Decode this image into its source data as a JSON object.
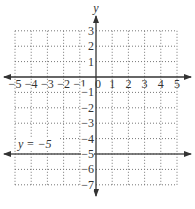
{
  "chart_data": {
    "type": "line",
    "title": "",
    "xlabel": "",
    "ylabel": "y",
    "xlim": [
      -5,
      5
    ],
    "ylim": [
      -7,
      3
    ],
    "grid": true,
    "grid_style": "dotted",
    "x_ticks": [
      -5,
      -4,
      -3,
      -2,
      -1,
      0,
      1,
      2,
      3,
      4,
      5
    ],
    "y_ticks": [
      3,
      2,
      1,
      -1,
      -2,
      -3,
      -4,
      -5,
      -6,
      -7
    ],
    "x_tick_labels": [
      "−5",
      "−4",
      "−3",
      "−2",
      "−1",
      "0",
      "1",
      "2",
      "3",
      "4",
      "5"
    ],
    "y_tick_labels": [
      "3",
      "2",
      "1",
      "−1",
      "−2",
      "−3",
      "−4",
      "−5",
      "−6",
      "−7"
    ],
    "series": [
      {
        "name": "y = −5",
        "equation": "y = -5",
        "x": [
          -5.8,
          5.8
        ],
        "y": [
          -5,
          -5
        ],
        "arrows": "both"
      }
    ],
    "annotations": [
      {
        "text": "y = −5",
        "x": -4.7,
        "y": -4.4
      }
    ],
    "legend": null
  },
  "labels": {
    "y_axis": "y",
    "line_label": "y = −5"
  },
  "colors": {
    "axis": "#333333",
    "grid": "#777777",
    "line": "#555555",
    "text": "#333333"
  }
}
